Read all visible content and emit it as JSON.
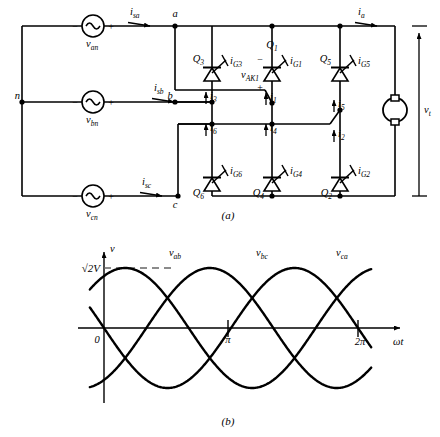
{
  "figure": {
    "panel_a_caption": "(a)",
    "panel_b_caption": "(b)"
  },
  "circuit": {
    "neutral_label": "n",
    "sources": [
      {
        "name": "source-a",
        "voltage_label": "v",
        "voltage_sub": "an",
        "current_label": "i",
        "current_sub": "sa",
        "node": "a",
        "minus": "−",
        "plus": "+"
      },
      {
        "name": "source-b",
        "voltage_label": "v",
        "voltage_sub": "bn",
        "current_label": "i",
        "current_sub": "sb",
        "node": "b",
        "minus": "−",
        "plus": "+"
      },
      {
        "name": "source-c",
        "voltage_label": "v",
        "voltage_sub": "cn",
        "current_label": "i",
        "current_sub": "cn_disp",
        "node": "c",
        "minus": "−",
        "plus": "+"
      }
    ],
    "source_c_current_sub": "sc",
    "thyristors": [
      {
        "id": "Q3",
        "name": "thyristor-q3",
        "label": "Q",
        "sub": "3",
        "gate_label": "i",
        "gate_sub": "G3",
        "position": "upper-left"
      },
      {
        "id": "Q1",
        "name": "thyristor-q1",
        "label": "Q",
        "sub": "1",
        "gate_label": "i",
        "gate_sub": "G1",
        "position": "upper-mid"
      },
      {
        "id": "Q5",
        "name": "thyristor-q5",
        "label": "Q",
        "sub": "5",
        "gate_label": "i",
        "gate_sub": "G5",
        "position": "upper-right"
      },
      {
        "id": "Q6",
        "name": "thyristor-q6",
        "label": "Q",
        "sub": "6",
        "gate_label": "i",
        "gate_sub": "G6",
        "position": "lower-left"
      },
      {
        "id": "Q4",
        "name": "thyristor-q4",
        "label": "Q",
        "sub": "4",
        "gate_label": "i",
        "gate_sub": "G4",
        "position": "lower-mid"
      },
      {
        "id": "Q2",
        "name": "thyristor-q2",
        "label": "Q",
        "sub": "2",
        "gate_label": "i",
        "gate_sub": "G2",
        "position": "lower-right"
      }
    ],
    "branch_currents": [
      {
        "label": "i",
        "sub": "3"
      },
      {
        "label": "i",
        "sub": "1"
      },
      {
        "label": "i",
        "sub": "5"
      },
      {
        "label": "i",
        "sub": "6"
      },
      {
        "label": "i",
        "sub": "4"
      },
      {
        "label": "i",
        "sub": "2"
      }
    ],
    "device_voltage": {
      "label": "v",
      "sub": "AK1",
      "minus": "−",
      "plus": "+"
    },
    "output": {
      "current_label": "i",
      "current_sub": "a",
      "voltage_label": "v",
      "voltage_sub": "t",
      "load_name": "dc-motor"
    }
  },
  "chart_data": {
    "type": "line",
    "title": "",
    "xlabel": "ωt",
    "ylabel": "v",
    "origin_label": "0",
    "peak_label": "√2V",
    "xticks": [
      {
        "value": 3.14159,
        "label": "π"
      },
      {
        "value": 6.28318,
        "label": "2π"
      }
    ],
    "xlim": [
      -0.35,
      7.2
    ],
    "ylim": [
      -1.25,
      1.25
    ],
    "grid": false,
    "legend_position": "inline-above-peaks",
    "amplitude": 1.0,
    "series": [
      {
        "name": "v_ab",
        "label": "v",
        "sub": "ab",
        "phase_deg": -60,
        "label_x": 1.55,
        "color": "#000000"
      },
      {
        "name": "v_bc",
        "label": "v",
        "sub": "bc",
        "phase_deg": -180,
        "label_x": 3.62,
        "color": "#000000"
      },
      {
        "name": "v_ca",
        "label": "v",
        "sub": "ca",
        "phase_deg": -300,
        "label_x": 5.72,
        "color": "#000000"
      }
    ],
    "note": "Three line-to-line voltages, each sqrt(2)V peak, mutually displaced 120 degrees; v_ab peaks at wt = pi/2 + ... shown peaking near 1.6 rad"
  }
}
